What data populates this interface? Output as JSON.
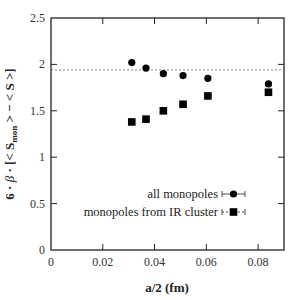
{
  "chart_data": {
    "type": "scatter",
    "title": "",
    "xlabel": "a/2 (fm)",
    "ylabel": "6 · β · [< S_mon > − < S >]",
    "xlim": [
      0,
      0.09
    ],
    "ylim": [
      0,
      2.5
    ],
    "xticks": [
      "0",
      "0.02",
      "0.04",
      "0.06",
      "0.08"
    ],
    "yticks": [
      "0",
      "0.5",
      "1",
      "1.5",
      "2",
      "2.5"
    ],
    "grid": false,
    "legend_position": "lower right",
    "reference_line": {
      "y": 1.94,
      "style": "dashed"
    },
    "series": [
      {
        "name": "all monopoles",
        "marker": "circle",
        "x": [
          0.0312,
          0.0367,
          0.0434,
          0.051,
          0.0606,
          0.084
        ],
        "y": [
          2.02,
          1.96,
          1.9,
          1.88,
          1.85,
          1.79
        ]
      },
      {
        "name": "monopoles from IR cluster",
        "marker": "square",
        "x": [
          0.0312,
          0.0367,
          0.0434,
          0.051,
          0.0606,
          0.084
        ],
        "y": [
          1.38,
          1.41,
          1.5,
          1.57,
          1.66,
          1.7
        ]
      }
    ]
  }
}
